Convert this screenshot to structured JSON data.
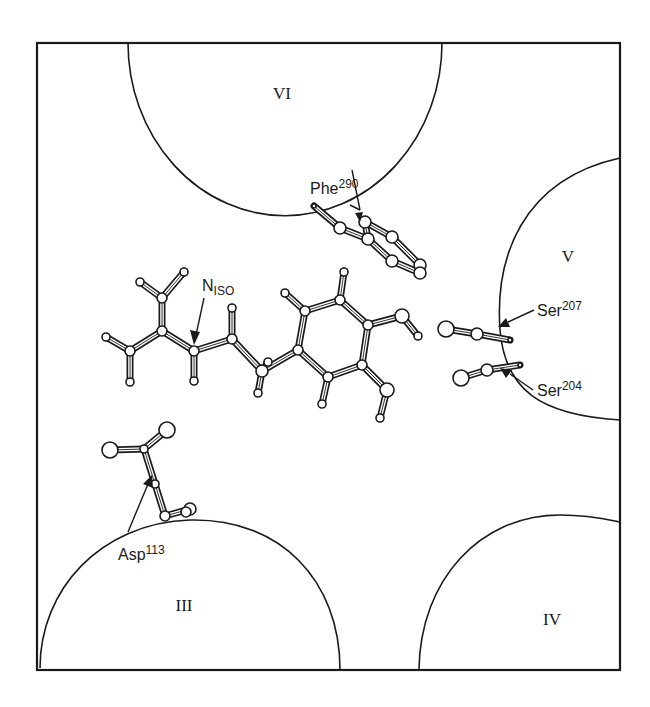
{
  "figure": {
    "helices": [
      {
        "id": "helix-vi",
        "label": "VI"
      },
      {
        "id": "helix-v",
        "label": "V"
      },
      {
        "id": "helix-iii",
        "label": "III"
      },
      {
        "id": "helix-iv",
        "label": "IV"
      }
    ],
    "residues": {
      "phe": {
        "name": "Phe",
        "number": "290"
      },
      "ser207": {
        "name": "Ser",
        "number": "207"
      },
      "ser204": {
        "name": "Ser",
        "number": "204"
      },
      "asp": {
        "name": "Asp",
        "number": "113"
      }
    },
    "ligand": {
      "label_main": "N",
      "label_sub": "ISO"
    }
  }
}
